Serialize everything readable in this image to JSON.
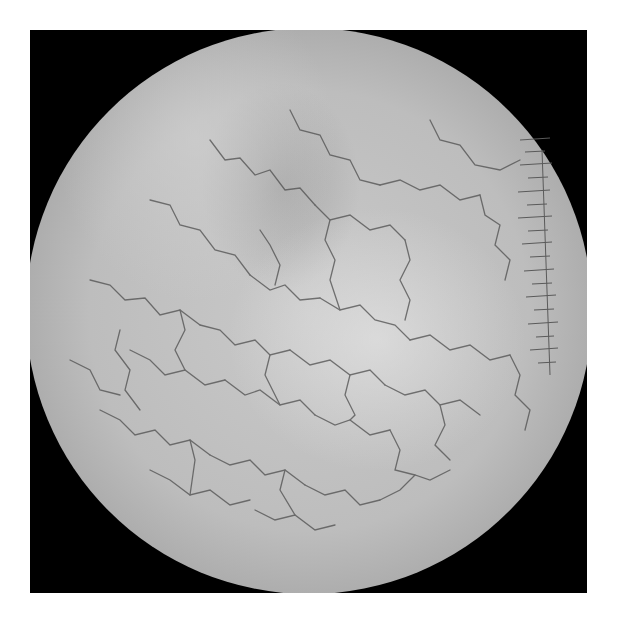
{
  "image": {
    "description": "Grayscale dermoscopic image showing a circular field of view with a reticular network of fine dark vessels over pale skin, with a scale ruler along the right edge",
    "background_color": "#ffffff",
    "frame_color": "#000000",
    "field_shape": "circle",
    "scale_ruler": {
      "position": "right",
      "tick_count": 18
    },
    "colors": {
      "skin_center": "#c9c9c9",
      "skin_edge": "#6a6a6a",
      "vessel": "#555555",
      "ruler_tick": "#5a5a5a"
    }
  }
}
